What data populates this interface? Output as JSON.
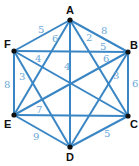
{
  "graph": {
    "type": "complete-weighted-graph",
    "colors": {
      "edge": "#3a86c4",
      "weight_label": "#6aa8d8",
      "vertex": "#111111"
    },
    "vertices": [
      {
        "id": "A",
        "label": "A",
        "x": 70,
        "y": 20,
        "lx": 66,
        "ly": 14
      },
      {
        "id": "B",
        "label": "B",
        "x": 128,
        "y": 52,
        "lx": 130,
        "ly": 49
      },
      {
        "id": "C",
        "label": "C",
        "x": 128,
        "y": 116,
        "lx": 130,
        "ly": 128
      },
      {
        "id": "D",
        "label": "D",
        "x": 70,
        "y": 147,
        "lx": 66,
        "ly": 161
      },
      {
        "id": "E",
        "label": "E",
        "x": 14,
        "y": 115,
        "lx": 4,
        "ly": 128
      },
      {
        "id": "F",
        "label": "F",
        "x": 14,
        "y": 51,
        "lx": 4,
        "ly": 48
      }
    ],
    "edges": [
      {
        "from": "A",
        "to": "F",
        "weight": "5",
        "lx": 38,
        "ly": 33
      },
      {
        "from": "A",
        "to": "B",
        "weight": "8",
        "lx": 101,
        "ly": 34
      },
      {
        "from": "A",
        "to": "E",
        "weight": "6",
        "lx": 52,
        "ly": 42
      },
      {
        "from": "A",
        "to": "C",
        "weight": "2",
        "lx": 86,
        "ly": 41
      },
      {
        "from": "F",
        "to": "B",
        "weight": "5",
        "lx": 100,
        "ly": 50
      },
      {
        "from": "F",
        "to": "C",
        "weight": "4",
        "lx": 35,
        "ly": 62
      },
      {
        "from": "A",
        "to": "D",
        "weight": "4",
        "lx": 64,
        "ly": 70
      },
      {
        "from": "B",
        "to": "E",
        "weight": "6",
        "lx": 103,
        "ly": 62
      },
      {
        "from": "B",
        "to": "D",
        "weight": "3",
        "lx": 113,
        "ly": 79
      },
      {
        "from": "B",
        "to": "C",
        "weight": "6",
        "lx": 132,
        "ly": 87
      },
      {
        "from": "F",
        "to": "E",
        "weight": "8",
        "lx": 4,
        "ly": 88
      },
      {
        "from": "F",
        "to": "D",
        "weight": "3",
        "lx": 19,
        "ly": 80
      },
      {
        "from": "E",
        "to": "C",
        "weight": "7",
        "lx": 36,
        "ly": 113
      },
      {
        "from": "E",
        "to": "D",
        "weight": "9",
        "lx": 33,
        "ly": 140
      },
      {
        "from": "D",
        "to": "C",
        "weight": "5",
        "lx": 104,
        "ly": 137
      }
    ]
  }
}
